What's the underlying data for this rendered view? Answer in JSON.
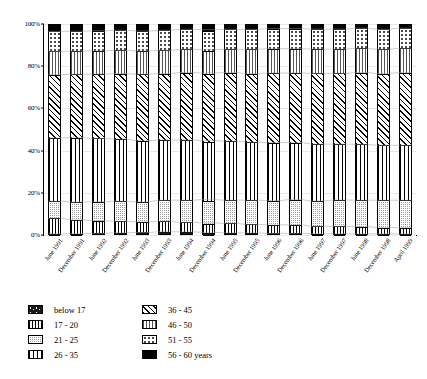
{
  "chart_data": {
    "type": "bar",
    "subtype": "stacked-percentage",
    "title": "",
    "xlabel": "",
    "ylabel": "",
    "ylim": [
      0,
      100
    ],
    "y_tick_labels": [
      "0%",
      "20%",
      "40%",
      "60%",
      "80%",
      "100%"
    ],
    "y_ticks": [
      0,
      20,
      40,
      60,
      80,
      100
    ],
    "grid": true,
    "legend_position": "bottom",
    "categories": [
      "June 1991",
      "December 1991",
      "June 1992",
      "December 1992",
      "June 1993",
      "December 1993",
      "June 1994",
      "December 1994",
      "June 1995",
      "December 1995",
      "June 1996",
      "December 1996",
      "June 1997",
      "December 1997",
      "June 1998",
      "December 1998",
      "April 1999"
    ],
    "series": [
      {
        "name": "below 17",
        "pattern": "dark-dotted",
        "color": "#1a1a1a",
        "values": [
          0.5,
          0.6,
          0.8,
          1.0,
          1.2,
          1.5,
          1.5,
          1.3,
          1.0,
          1.0,
          0.8,
          0.8,
          0.6,
          0.6,
          0.5,
          0.5,
          0.5
        ]
      },
      {
        "name": "17 - 20",
        "pattern": "vertical-stripes",
        "color": "#ffffff",
        "values": [
          7.5,
          6.5,
          6.0,
          5.5,
          5.0,
          5.0,
          4.5,
          4.5,
          4.5,
          4.0,
          4.0,
          4.0,
          3.5,
          3.5,
          3.5,
          3.0,
          3.0
        ]
      },
      {
        "name": "21 - 25",
        "pattern": "fine-dots",
        "color": "#9a9a9a",
        "values": [
          8.0,
          8.5,
          9.0,
          9.5,
          9.5,
          10.0,
          10.5,
          11.0,
          11.0,
          11.5,
          11.5,
          12.0,
          12.0,
          12.5,
          12.5,
          13.0,
          13.0
        ]
      },
      {
        "name": "26 - 35",
        "pattern": "grid",
        "color": "#ffffff",
        "values": [
          30.0,
          30.5,
          30.0,
          29.5,
          29.0,
          28.5,
          28.5,
          28.0,
          28.0,
          27.5,
          27.5,
          27.0,
          27.0,
          26.5,
          26.5,
          26.0,
          26.0
        ]
      },
      {
        "name": "36 - 45",
        "pattern": "cross-hatch",
        "color": "#ffffff",
        "values": [
          30.0,
          30.0,
          30.5,
          31.0,
          31.5,
          31.5,
          32.0,
          32.0,
          32.5,
          32.5,
          33.0,
          33.0,
          33.5,
          33.5,
          34.0,
          34.0,
          34.5
        ]
      },
      {
        "name": "46 - 50",
        "pattern": "horizontal-dashes",
        "color": "#ffffff",
        "values": [
          11.0,
          11.0,
          11.0,
          11.0,
          11.0,
          11.0,
          11.0,
          11.0,
          11.0,
          11.5,
          11.5,
          11.5,
          11.5,
          11.5,
          11.5,
          11.5,
          11.5
        ]
      },
      {
        "name": "51 - 55",
        "pattern": "sparse-dots",
        "color": "#ffffff",
        "values": [
          9.5,
          9.5,
          9.5,
          9.5,
          9.5,
          9.5,
          9.5,
          9.5,
          9.5,
          9.5,
          9.5,
          9.5,
          9.5,
          9.5,
          9.5,
          9.5,
          9.5
        ]
      },
      {
        "name": "56 - 60 years",
        "pattern": "solid-black",
        "color": "#000000",
        "values": [
          3.5,
          3.4,
          3.2,
          3.0,
          3.3,
          3.0,
          2.5,
          3.2,
          2.5,
          2.5,
          2.2,
          2.2,
          2.4,
          2.4,
          2.0,
          2.5,
          2.0
        ]
      }
    ]
  },
  "legend": {
    "items": [
      {
        "label": "below 17",
        "pattern": "below17"
      },
      {
        "label": "17 - 20",
        "pattern": "17-20"
      },
      {
        "label": "21 - 25",
        "pattern": "21-25"
      },
      {
        "label": "26 - 35",
        "pattern": "26-35"
      },
      {
        "label": "36 - 45",
        "pattern": "36-45"
      },
      {
        "label": "46 - 50",
        "pattern": "46-50"
      },
      {
        "label": "51 - 55",
        "pattern": "51-55"
      },
      {
        "label": "56 - 60 years",
        "pattern": "56-60"
      }
    ]
  }
}
